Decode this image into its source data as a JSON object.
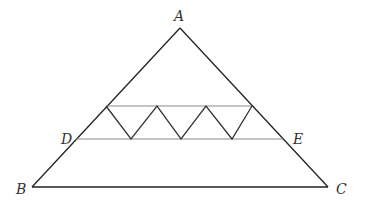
{
  "diagram": {
    "type": "geometry",
    "labels": {
      "A": "A",
      "B": "B",
      "C": "C",
      "D": "D",
      "E": "E"
    },
    "colors": {
      "sides": "#222222",
      "horizontals": "#8a8a8a",
      "zigzag": "#333333",
      "text": "#333333"
    }
  }
}
